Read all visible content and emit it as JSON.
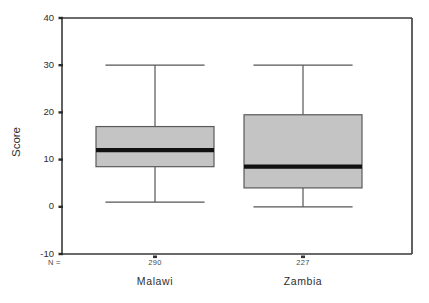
{
  "chart_data": {
    "type": "box",
    "title": "",
    "xlabel": "",
    "ylabel": "Score",
    "ylim": [
      -10,
      40
    ],
    "yticks": [
      40,
      30,
      20,
      10,
      0,
      -10
    ],
    "ytick_labels": [
      "40",
      "30",
      "20",
      "10",
      "0",
      "-10"
    ],
    "grid": false,
    "legend": "none",
    "categories": [
      "Malawi",
      "Zambia"
    ],
    "n_prefix": "N =",
    "n_values": [
      "290",
      "227"
    ],
    "boxes": [
      {
        "category": "Malawi",
        "n": 290,
        "whisker_low": 1,
        "q1": 8.5,
        "median": 12,
        "q3": 17,
        "whisker_high": 30
      },
      {
        "category": "Zambia",
        "n": 227,
        "whisker_low": 0,
        "q1": 4,
        "median": 8.5,
        "q3": 19.5,
        "whisker_high": 30
      }
    ],
    "colors": {
      "box_fill": "#c4c4c4",
      "box_stroke": "#5a5a5a",
      "median": "#111111",
      "whisker": "#555555",
      "axis": "#3a3a3a",
      "text": "#2e2e2e",
      "background": "#ffffff"
    }
  }
}
